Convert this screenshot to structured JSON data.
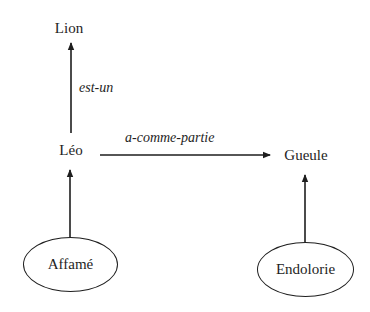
{
  "diagram": {
    "type": "semantic-network",
    "nodes": {
      "lion": {
        "label": "Lion",
        "shape": "plain"
      },
      "leo": {
        "label": "Léo",
        "shape": "plain"
      },
      "gueule": {
        "label": "Gueule",
        "shape": "plain"
      },
      "affame": {
        "label": "Affamé",
        "shape": "ellipse"
      },
      "endolorie": {
        "label": "Endolorie",
        "shape": "ellipse"
      }
    },
    "edges": {
      "est_un": {
        "from": "Léo",
        "to": "Lion",
        "label": "est-un"
      },
      "a_comme_partie": {
        "from": "Léo",
        "to": "Gueule",
        "label": "a-comme-partie"
      },
      "affame_leo": {
        "from": "Affamé",
        "to": "Léo",
        "label": ""
      },
      "endolorie_gueule": {
        "from": "Endolorie",
        "to": "Gueule",
        "label": ""
      }
    },
    "colors": {
      "ink": "#1e1e1e",
      "background": "#ffffff"
    }
  }
}
